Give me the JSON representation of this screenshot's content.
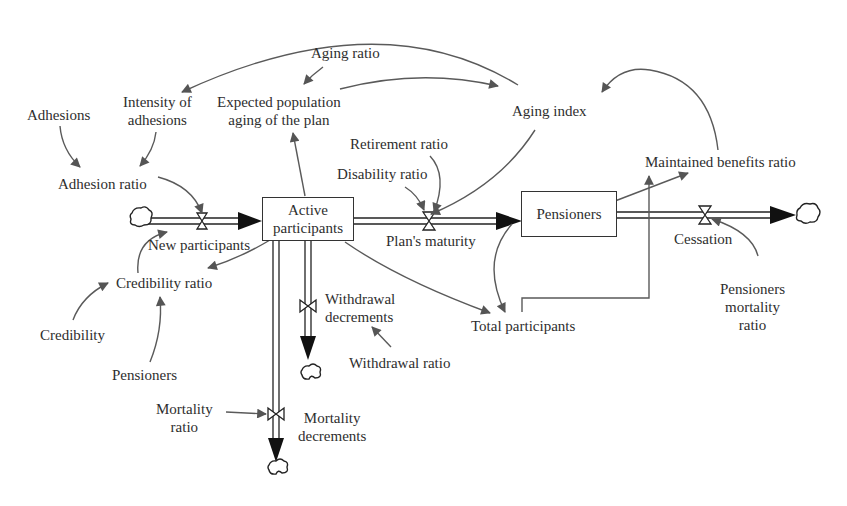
{
  "diagram": {
    "type": "stock-and-flow",
    "stocks": [
      {
        "id": "active",
        "label_line1": "Active",
        "label_line2": "participants"
      },
      {
        "id": "pensioners",
        "label": "Pensioners"
      }
    ],
    "flows": [
      {
        "id": "new_participants",
        "label": "New participants",
        "from": "source-cloud",
        "to": "active"
      },
      {
        "id": "plans_maturity",
        "label": "Plan's maturity",
        "from": "active",
        "to": "pensioners"
      },
      {
        "id": "cessation",
        "label": "Cessation",
        "from": "pensioners",
        "to": "sink-cloud"
      },
      {
        "id": "withdrawal_decrements",
        "label_line1": "Withdrawal",
        "label_line2": "decrements",
        "from": "active",
        "to": "sink-cloud"
      },
      {
        "id": "mortality_decrements",
        "label_line1": "Mortality",
        "label_line2": "decrements",
        "from": "active",
        "to": "sink-cloud"
      }
    ],
    "variables": {
      "adhesions": "Adhesions",
      "intensity_line1": "Intensity of",
      "intensity_line2": "adhesions",
      "aging_ratio": "Aging ratio",
      "expected_line1": "Expected population",
      "expected_line2": "aging of the plan",
      "aging_index": "Aging index",
      "adhesion_ratio": "Adhesion ratio",
      "retirement_ratio": "Retirement ratio",
      "disability_ratio": "Disability ratio",
      "maintained_benefits_ratio": "Maintained benefits ratio",
      "credibility_ratio": "Credibility ratio",
      "credibility": "Credibility",
      "pensioners_var": "Pensioners",
      "total_participants": "Total participants",
      "withdrawal_ratio": "Withdrawal ratio",
      "mortality_ratio_line1": "Mortality",
      "mortality_ratio_line2": "ratio",
      "pensioners_mortality_line1": "Pensioners",
      "pensioners_mortality_line2": "mortality",
      "pensioners_mortality_line3": "ratio"
    },
    "colors": {
      "link": "#5a5a5a",
      "arrowhead": "#555555",
      "pipe": "#222222",
      "text": "#2e2e2e",
      "background": "#ffffff"
    }
  }
}
